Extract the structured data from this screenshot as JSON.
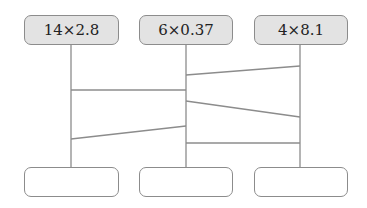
{
  "diagram": {
    "type": "ladder",
    "top_boxes": [
      {
        "label": "14×2.8"
      },
      {
        "label": "6×0.37"
      },
      {
        "label": "4×8.1"
      }
    ],
    "bottom_boxes": [
      {
        "value": ""
      },
      {
        "value": ""
      },
      {
        "value": ""
      }
    ],
    "rungs": [
      {
        "from": "middle",
        "to": "right"
      },
      {
        "from": "left",
        "to": "middle"
      },
      {
        "from": "middle",
        "to": "right"
      },
      {
        "from": "left",
        "to": "middle"
      },
      {
        "from": "middle",
        "to": "right"
      }
    ],
    "line_color": "#8c8c8c",
    "top_box_fill": "#e3e3e3"
  }
}
